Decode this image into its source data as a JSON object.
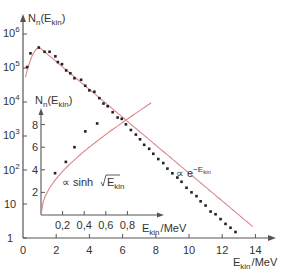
{
  "chart_data": [
    {
      "type": "scatter",
      "title": "",
      "xlabel": "E_kin / MeV",
      "ylabel": "N_n(E_kin)",
      "yscale": "log",
      "xlim": [
        0,
        15
      ],
      "ylim": [
        1,
        1000000
      ],
      "x_ticks": [
        "0",
        "2",
        "4",
        "6",
        "8",
        "10",
        "12",
        "14"
      ],
      "y_ticks": [
        "1",
        "10",
        "10^2",
        "10^3",
        "10^4",
        "10^5",
        "10^6"
      ],
      "grid": false,
      "legend": null,
      "annotations": [
        "∝ e^(-E_kin)"
      ],
      "fit_curve": {
        "color": "#d9868a",
        "description": "rise then exponential fall ∝ e^(-E_kin)"
      },
      "series": [
        {
          "name": "measured neutron spectrum",
          "x": [
            0.25,
            0.45,
            0.95,
            1.3,
            1.6,
            1.95,
            2.1,
            2.35,
            2.6,
            2.85,
            3.1,
            3.5,
            3.75,
            4.0,
            4.3,
            4.6,
            4.85,
            5.1,
            5.4,
            5.7,
            5.95,
            6.2,
            6.5,
            6.8,
            7.05,
            7.3,
            7.6,
            7.85,
            8.15,
            8.45,
            8.7,
            9.0,
            9.3,
            9.55,
            9.85,
            10.15,
            10.45,
            10.7,
            11.0,
            11.3,
            11.6,
            11.9,
            12.2,
            12.5,
            12.8
          ],
          "y": [
            107000,
            270000,
            400000,
            300000,
            300000,
            220000,
            150000,
            130000,
            85000,
            70000,
            50000,
            45000,
            30000,
            22000,
            20000,
            13000,
            9000,
            7500,
            5000,
            3500,
            3200,
            2200,
            1500,
            1100,
            800,
            550,
            420,
            300,
            210,
            160,
            110,
            80,
            60,
            45,
            30,
            22,
            17,
            12,
            9,
            6,
            5,
            3.6,
            2.6,
            2.0,
            1.5
          ]
        }
      ],
      "inset": {
        "type": "scatter",
        "xlabel": "E_kin / MeV",
        "ylabel": "N_n(E_kin)",
        "yscale": "linear",
        "xlim": [
          0,
          1.0
        ],
        "ylim": [
          0,
          9
        ],
        "x_ticks": [
          "0,2",
          "0,4",
          "0,6",
          "0,8"
        ],
        "y_ticks": [
          "2",
          "4",
          "6",
          "8"
        ],
        "annotations": [
          "∝ sinh√E_kin"
        ],
        "fit_curve": {
          "color": "#d9868a",
          "description": "∝ sinh√E_kin"
        },
        "series": [
          {
            "name": "low-energy data",
            "x": [
              0.13,
              0.23,
              0.31,
              0.41,
              0.52
            ],
            "y": [
              3.7,
              4.7,
              6.0,
              7.4,
              8.1
            ]
          }
        ]
      }
    }
  ],
  "labels": {
    "main_ylabel": "N",
    "main_ylabel_sub": "n",
    "main_ylabel_arg": "(E",
    "main_ylabel_arg_sub": "kin",
    "main_ylabel_close": ")",
    "main_xlabel": "E",
    "main_xlabel_sub": "kin",
    "main_xlabel_unit": "/MeV",
    "inset_ylabel": "N",
    "inset_ylabel_sub": "n",
    "inset_ylabel_arg": "(E",
    "inset_ylabel_arg_sub": "kin",
    "inset_ylabel_close": ")",
    "inset_xlabel": "E",
    "inset_xlabel_sub": "kin",
    "inset_xlabel_unit": "/MeV",
    "exp_annot_prefix": "∝ e",
    "exp_annot_sup": "−E",
    "exp_annot_sup_sub": "kin",
    "sinh_annot_prefix": "∝ sinh",
    "sinh_annot_arg": "E",
    "sinh_annot_arg_sub": "kin",
    "y_tick_1": "1",
    "y_tick_10": "10",
    "y_tick_base": "10",
    "y_tick_exp_2": "2",
    "y_tick_exp_3": "3",
    "y_tick_exp_4": "4",
    "y_tick_exp_5": "5",
    "y_tick_exp_6": "6"
  },
  "colors": {
    "axis": "#555555",
    "fit_curve": "#d9868a",
    "points": "#222222",
    "text": "#333333"
  }
}
